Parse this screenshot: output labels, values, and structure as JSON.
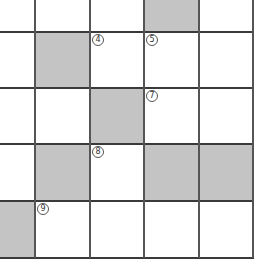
{
  "puzzle": {
    "type": "crossword-grid-fragment",
    "rows": 5,
    "cols": 5,
    "colors": {
      "block": "#c4c4c4",
      "line": "#3a3a3a",
      "white": "#ffffff"
    },
    "col_edges": [
      0,
      35,
      90,
      144,
      199,
      253
    ],
    "row_edges": [
      0,
      32,
      88,
      144,
      201,
      258
    ],
    "cells": [
      [
        {
          "block": false
        },
        {
          "block": false
        },
        {
          "block": false
        },
        {
          "block": true
        },
        {
          "block": false
        }
      ],
      [
        {
          "block": false
        },
        {
          "block": true
        },
        {
          "block": false,
          "number": "④"
        },
        {
          "block": false,
          "number": "⑤"
        },
        {
          "block": false
        }
      ],
      [
        {
          "block": false
        },
        {
          "block": false
        },
        {
          "block": true
        },
        {
          "block": false,
          "number": "⑦"
        },
        {
          "block": false
        }
      ],
      [
        {
          "block": false
        },
        {
          "block": true
        },
        {
          "block": false,
          "number": "⑧"
        },
        {
          "block": true
        },
        {
          "block": true
        }
      ],
      [
        {
          "block": true
        },
        {
          "block": false,
          "number": "⑨"
        },
        {
          "block": false
        },
        {
          "block": false
        },
        {
          "block": false
        }
      ]
    ],
    "numbers": {
      "n4": "4",
      "n5": "5",
      "n7": "7",
      "n8": "8",
      "n9": "9"
    }
  }
}
